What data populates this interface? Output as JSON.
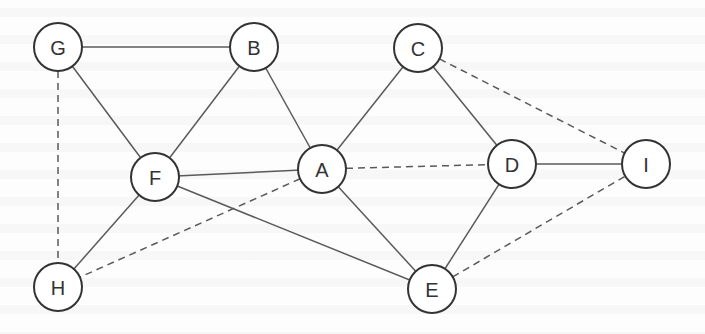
{
  "diagram": {
    "type": "undirected-graph",
    "node_radius": 24,
    "colors": {
      "edge": "#5a5a5a",
      "node_stroke": "#333333",
      "node_fill": "#ffffff",
      "label": "#333333",
      "background": "#fdfdfd"
    },
    "nodes": [
      {
        "id": "G",
        "label": "G",
        "x": 58,
        "y": 47
      },
      {
        "id": "B",
        "label": "B",
        "x": 254,
        "y": 47
      },
      {
        "id": "C",
        "label": "C",
        "x": 418,
        "y": 48
      },
      {
        "id": "F",
        "label": "F",
        "x": 155,
        "y": 177
      },
      {
        "id": "A",
        "label": "A",
        "x": 322,
        "y": 169
      },
      {
        "id": "D",
        "label": "D",
        "x": 512,
        "y": 164
      },
      {
        "id": "I",
        "label": "I",
        "x": 646,
        "y": 164
      },
      {
        "id": "H",
        "label": "H",
        "x": 58,
        "y": 287
      },
      {
        "id": "E",
        "label": "E",
        "x": 432,
        "y": 289
      }
    ],
    "edges": [
      {
        "from": "G",
        "to": "B",
        "style": "solid"
      },
      {
        "from": "G",
        "to": "F",
        "style": "solid"
      },
      {
        "from": "G",
        "to": "H",
        "style": "dashed"
      },
      {
        "from": "B",
        "to": "F",
        "style": "solid"
      },
      {
        "from": "B",
        "to": "A",
        "style": "solid"
      },
      {
        "from": "F",
        "to": "A",
        "style": "solid"
      },
      {
        "from": "F",
        "to": "H",
        "style": "solid"
      },
      {
        "from": "F",
        "to": "E",
        "style": "solid"
      },
      {
        "from": "A",
        "to": "H",
        "style": "dashed"
      },
      {
        "from": "A",
        "to": "C",
        "style": "solid"
      },
      {
        "from": "A",
        "to": "D",
        "style": "dashed"
      },
      {
        "from": "A",
        "to": "E",
        "style": "solid"
      },
      {
        "from": "C",
        "to": "D",
        "style": "solid"
      },
      {
        "from": "C",
        "to": "I",
        "style": "dashed"
      },
      {
        "from": "D",
        "to": "I",
        "style": "solid"
      },
      {
        "from": "D",
        "to": "E",
        "style": "solid"
      },
      {
        "from": "E",
        "to": "I",
        "style": "dashed"
      }
    ]
  }
}
